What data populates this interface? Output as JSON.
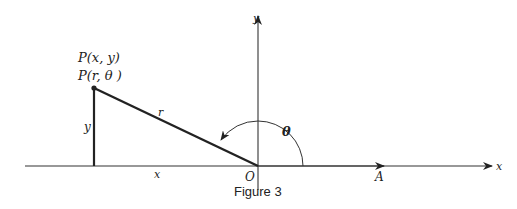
{
  "figure": {
    "caption": "Figure 3",
    "point_labels": {
      "cartesian": "P(x, y)",
      "polar": "P(r, θ )"
    },
    "labels": {
      "y_axis": "y",
      "x_axis": "x",
      "origin": "O",
      "polar_axis": "A",
      "radius": "r",
      "angle": "θ",
      "vertical_leg": "y",
      "horizontal_leg": "x"
    },
    "colors": {
      "line": "#222222",
      "background": "#ffffff"
    }
  }
}
